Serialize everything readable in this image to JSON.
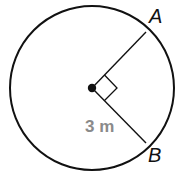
{
  "diagram": {
    "type": "circle-with-radii",
    "center": {
      "x": 92,
      "y": 88
    },
    "radius": 82,
    "points": [
      {
        "name": "A",
        "x": 146,
        "y": 32
      },
      {
        "name": "B",
        "x": 146,
        "y": 143
      }
    ],
    "labels": {
      "point_a": "A",
      "point_b": "B",
      "radius_measure": "3 m"
    },
    "angle_marker": "right-angle",
    "colors": {
      "stroke": "#111111",
      "measure_text": "#8a8a8a"
    }
  }
}
